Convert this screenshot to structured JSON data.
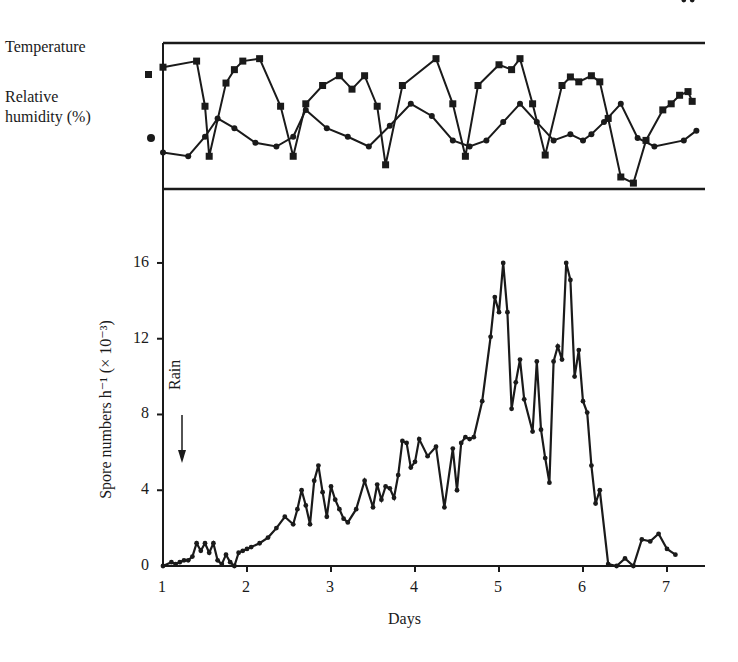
{
  "chart_data": [
    {
      "type": "line",
      "title": "",
      "panel": "top",
      "legend": [
        {
          "label": "Temperature",
          "marker": "square"
        },
        {
          "label": "Relative humidity (%)",
          "marker": "circle"
        }
      ],
      "xlim": [
        1,
        7.5
      ],
      "series": [
        {
          "name": "Temperature",
          "marker": "square",
          "x": [
            1.0,
            1.4,
            1.5,
            1.55,
            1.75,
            1.85,
            1.95,
            2.15,
            2.4,
            2.55,
            2.7,
            2.9,
            3.1,
            3.25,
            3.4,
            3.55,
            3.65,
            3.85,
            4.25,
            4.45,
            4.6,
            4.75,
            5.0,
            5.15,
            5.25,
            5.4,
            5.55,
            5.75,
            5.85,
            5.95,
            6.1,
            6.2,
            6.3,
            6.45,
            6.6,
            6.75,
            6.95,
            7.05,
            7.15,
            7.25,
            7.3
          ],
          "y": [
            0.9,
            0.95,
            0.58,
            0.17,
            0.77,
            0.88,
            0.95,
            0.97,
            0.58,
            0.17,
            0.6,
            0.75,
            0.83,
            0.72,
            0.83,
            0.58,
            0.1,
            0.75,
            0.97,
            0.6,
            0.17,
            0.75,
            0.92,
            0.88,
            0.97,
            0.6,
            0.18,
            0.75,
            0.82,
            0.78,
            0.83,
            0.78,
            0.48,
            0.0,
            -0.05,
            0.3,
            0.55,
            0.6,
            0.67,
            0.7,
            0.62
          ]
        },
        {
          "name": "Relative humidity (%)",
          "marker": "circle",
          "x": [
            1.0,
            1.3,
            1.5,
            1.65,
            1.85,
            2.1,
            2.35,
            2.55,
            2.7,
            2.95,
            3.2,
            3.45,
            3.7,
            3.95,
            4.2,
            4.45,
            4.65,
            4.85,
            5.05,
            5.25,
            5.45,
            5.65,
            5.85,
            6.0,
            6.1,
            6.25,
            6.45,
            6.65,
            6.85,
            7.2,
            7.35
          ],
          "y": [
            0.2,
            0.17,
            0.33,
            0.48,
            0.4,
            0.28,
            0.25,
            0.33,
            0.55,
            0.4,
            0.33,
            0.25,
            0.42,
            0.6,
            0.5,
            0.3,
            0.25,
            0.3,
            0.45,
            0.6,
            0.45,
            0.3,
            0.35,
            0.3,
            0.35,
            0.45,
            0.6,
            0.32,
            0.25,
            0.3,
            0.38
          ]
        }
      ],
      "note": "Values normalized 0-1 within panel; no y-axis ticks shown"
    },
    {
      "type": "line",
      "panel": "bottom",
      "title": "",
      "xlabel": "Days",
      "ylabel": "Spore numbers h⁻¹ (× 10⁻³)",
      "xticks": [
        1,
        2,
        3,
        4,
        5,
        6,
        7
      ],
      "yticks": [
        0,
        4,
        8,
        12,
        16
      ],
      "xlim": [
        1,
        7.5
      ],
      "ylim": [
        0,
        18
      ],
      "annotations": [
        {
          "text": "Rain",
          "x": 1.22,
          "arrow": "down"
        }
      ],
      "series": [
        {
          "name": "Spore numbers",
          "x": [
            1.0,
            1.1,
            1.15,
            1.2,
            1.25,
            1.3,
            1.35,
            1.4,
            1.45,
            1.5,
            1.55,
            1.6,
            1.65,
            1.7,
            1.75,
            1.8,
            1.85,
            1.9,
            1.95,
            2.0,
            2.05,
            2.15,
            2.25,
            2.35,
            2.45,
            2.55,
            2.6,
            2.65,
            2.7,
            2.75,
            2.8,
            2.85,
            2.9,
            2.95,
            3.0,
            3.05,
            3.1,
            3.15,
            3.2,
            3.3,
            3.4,
            3.5,
            3.55,
            3.6,
            3.65,
            3.7,
            3.75,
            3.8,
            3.85,
            3.9,
            3.95,
            4.0,
            4.05,
            4.15,
            4.25,
            4.35,
            4.45,
            4.5,
            4.55,
            4.6,
            4.65,
            4.7,
            4.8,
            4.9,
            4.95,
            5.0,
            5.05,
            5.1,
            5.15,
            5.2,
            5.25,
            5.3,
            5.4,
            5.45,
            5.5,
            5.55,
            5.6,
            5.65,
            5.7,
            5.75,
            5.8,
            5.85,
            5.9,
            5.95,
            6.0,
            6.05,
            6.1,
            6.15,
            6.2,
            6.3,
            6.4,
            6.5,
            6.6,
            6.7,
            6.8,
            6.9,
            7.0,
            7.1,
            7.2,
            7.3
          ],
          "y": [
            0.0,
            0.2,
            0.1,
            0.2,
            0.3,
            0.3,
            0.5,
            1.2,
            0.8,
            1.2,
            0.7,
            1.2,
            0.3,
            0.1,
            0.6,
            0.2,
            0.0,
            0.7,
            0.8,
            0.9,
            1.0,
            1.2,
            1.5,
            2.0,
            2.6,
            2.2,
            3.0,
            4.0,
            3.2,
            2.2,
            4.5,
            5.3,
            3.9,
            2.6,
            4.2,
            3.5,
            3.0,
            2.5,
            2.3,
            3.0,
            4.5,
            3.1,
            4.3,
            3.5,
            4.2,
            4.1,
            3.6,
            4.8,
            6.6,
            6.5,
            5.2,
            5.5,
            6.7,
            5.8,
            6.3,
            3.1,
            6.2,
            4.0,
            6.5,
            6.8,
            6.7,
            6.8,
            8.7,
            12.1,
            14.2,
            13.4,
            16.0,
            13.4,
            8.3,
            9.7,
            10.9,
            8.8,
            7.1,
            10.8,
            7.2,
            5.7,
            4.4,
            10.8,
            11.6,
            10.9,
            16.0,
            15.1,
            10.0,
            11.4,
            8.7,
            8.1,
            5.3,
            3.3,
            4.0,
            0.1,
            0.0,
            0.4,
            0.0,
            1.4,
            1.3,
            1.7,
            0.9,
            0.6
          ]
        }
      ]
    }
  ],
  "labels": {
    "temperature": "Temperature",
    "humidity_line1": "Relative",
    "humidity_line2": "humidity (%)",
    "rain": "Rain",
    "xlabel": "Days",
    "ylabel": "Spore numbers h⁻¹ (× 10⁻³)"
  },
  "xticks": [
    "1",
    "2",
    "3",
    "4",
    "5",
    "6",
    "7"
  ],
  "yticks": [
    "0",
    "4",
    "8",
    "12",
    "16"
  ]
}
